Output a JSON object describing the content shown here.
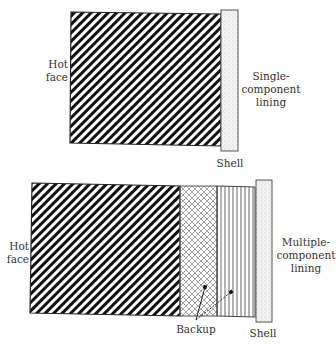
{
  "diagram": {
    "single": {
      "hot_face_line1": "Hot",
      "hot_face_line2": "face",
      "lining_line1": "Single-",
      "lining_line2": "component",
      "lining_line3": "lining",
      "shell_label": "Shell"
    },
    "multiple": {
      "hot_face_line1": "Hot",
      "hot_face_line2": "face",
      "lining_line1": "Multiple-",
      "lining_line2": "component",
      "lining_line3": "lining",
      "backup_label": "Backup",
      "shell_label": "Shell"
    },
    "colors": {
      "stroke": "#222222",
      "hatch": "#111111",
      "crosshatch": "#9a9a9a",
      "vertical_lines": "#555555",
      "shell_fill": "#eeeeee",
      "text": "#333333"
    }
  }
}
